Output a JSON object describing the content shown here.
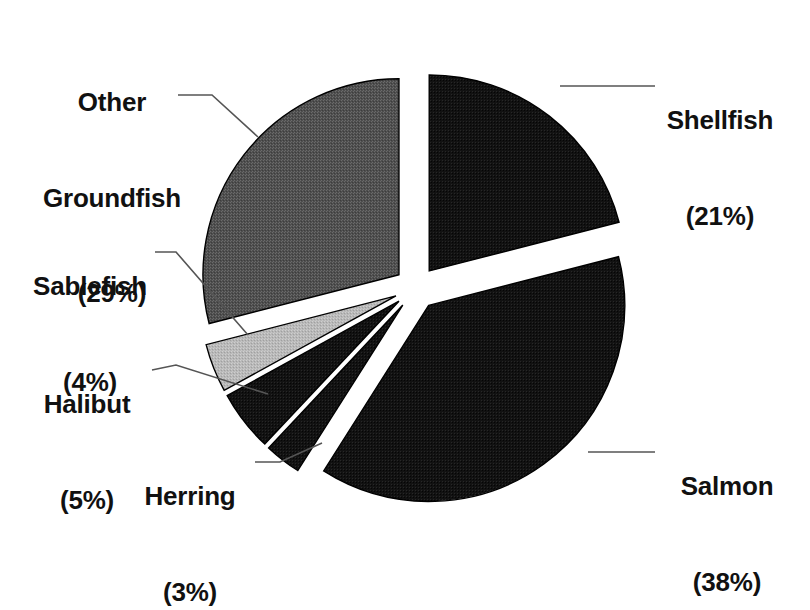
{
  "chart_data": {
    "type": "pie",
    "title": "",
    "subtitle": "",
    "xlabel": "",
    "ylabel": "",
    "legend_position": "none",
    "grid": false,
    "labels_show_percent": true,
    "exploded": true,
    "start_angle_deg": 0,
    "direction": "clockwise",
    "categories": [
      "Shellfish",
      "Salmon",
      "Herring",
      "Halibut",
      "Sablefish",
      "Other Groundfish"
    ],
    "values": [
      21,
      38,
      3,
      5,
      4,
      29
    ],
    "units": "percent",
    "slices": [
      {
        "name": "Shellfish",
        "value": 21,
        "percent_text": "(21%)",
        "fill": "#1a1a1a",
        "stroke": "#000000",
        "start_deg": 0,
        "end_deg": 75.6,
        "explode": 0.11
      },
      {
        "name": "Salmon",
        "value": 38,
        "percent_text": "(38%)",
        "fill": "#0d0d0d",
        "stroke": "#000000",
        "start_deg": 75.6,
        "end_deg": 212.4,
        "explode": 0.11
      },
      {
        "name": "Herring",
        "value": 3,
        "percent_text": "(3%)",
        "fill": "#141414",
        "stroke": "#000000",
        "start_deg": 212.4,
        "end_deg": 223.2,
        "explode": 0.11
      },
      {
        "name": "Halibut",
        "value": 5,
        "percent_text": "(5%)",
        "fill": "#242424",
        "stroke": "#000000",
        "start_deg": 223.2,
        "end_deg": 241.2,
        "explode": 0.11
      },
      {
        "name": "Sablefish",
        "value": 4,
        "percent_text": "(4%)",
        "fill": "#b3b3b3",
        "stroke": "#000000",
        "start_deg": 241.2,
        "end_deg": 255.6,
        "explode": 0.11
      },
      {
        "name": "Other Groundfish",
        "value": 29,
        "percent_text": "(29%)",
        "fill": "#565656",
        "stroke": "#000000",
        "start_deg": 255.6,
        "end_deg": 360,
        "explode": 0.11
      }
    ]
  },
  "labels": {
    "other_groundfish": {
      "line1": "Other",
      "line2": "Groundfish",
      "value": "(29%)"
    },
    "shellfish": {
      "name": "Shellfish",
      "value": "(21%)"
    },
    "sablefish": {
      "name": "Sablefish",
      "value": "(4%)"
    },
    "halibut": {
      "name": "Halibut",
      "value": "(5%)"
    },
    "herring": {
      "name": "Herring",
      "value": "(3%)"
    },
    "salmon": {
      "name": "Salmon",
      "value": "(38%)"
    }
  },
  "colors": {
    "background": "#ffffff",
    "text": "#111111",
    "leader_line": "#555555",
    "slice_dark": "#1a1a1a",
    "slice_mid_gray": "#565656",
    "slice_light_gray": "#b3b3b3",
    "outline": "#000000"
  }
}
